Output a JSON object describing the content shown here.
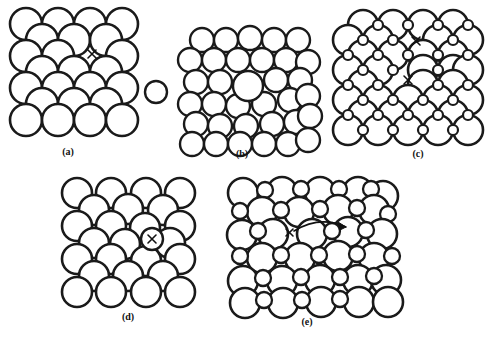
{
  "figure": {
    "background_color": "#ffffff",
    "line_color": "#1a1a1a",
    "atom_fill_color": "#ffffff",
    "panels": [
      {
        "id": "a",
        "label": "(a)",
        "label_x": 68,
        "label_y": 155,
        "description": "square lattice with vacancy and removed atom shown at right",
        "origin_x": 10,
        "origin_y": 8,
        "lattice": {
          "type": "square-offset",
          "cols": 4,
          "rows": 4,
          "spacing": 32,
          "radius_large": 16,
          "offset_x": 16,
          "offset_y": 16,
          "radius_small": 0
        },
        "defect_marks": [
          {
            "kind": "x",
            "x": 92,
            "y": 54,
            "size": 5
          }
        ],
        "extra_atoms": [
          {
            "x": 156,
            "y": 92,
            "r": 11,
            "kind": "removed-atom"
          }
        ]
      },
      {
        "id": "b",
        "label": "(b)",
        "label_x": 242,
        "label_y": 155,
        "description": "close-packed hexagonal arrangement containing one substitutional atom",
        "origin_x": 190,
        "origin_y": 30,
        "lattice": {
          "type": "close-packed",
          "cols": 5,
          "rows": 6,
          "spacing": 24,
          "radius_large": 12,
          "offset_x": 12,
          "offset_y": 21,
          "radius_small": 0
        },
        "defect_marks": [],
        "extra_atoms": [
          {
            "x": 242,
            "y": 85,
            "r": 15,
            "kind": "substitutional-atom"
          }
        ]
      },
      {
        "id": "c",
        "label": "(c)",
        "label_x": 418,
        "label_y": 155,
        "description": "ionic lattice of large anions and small cations with two Schottky vacancies",
        "origin_x": 348,
        "origin_y": 10,
        "lattice": {
          "type": "ionic-square",
          "cols": 4,
          "rows": 4,
          "spacing": 30,
          "radius_large": 15,
          "offset_x": 15,
          "offset_y": 15,
          "radius_small": 5
        },
        "defect_marks": [
          {
            "kind": "x",
            "x": 416,
            "y": 41,
            "size": 5
          },
          {
            "kind": "x",
            "x": 401,
            "y": 79,
            "size": 5
          }
        ],
        "extra_atoms": []
      },
      {
        "id": "d",
        "label": "(d)",
        "label_x": 128,
        "label_y": 318,
        "description": "square lattice with an interstitial atom squeezed between lattice sites",
        "origin_x": 62,
        "origin_y": 178,
        "lattice": {
          "type": "square-offset",
          "cols": 4,
          "rows": 4,
          "spacing": 30,
          "radius_large": 15,
          "offset_x": 15,
          "offset_y": 15,
          "radius_small": 0
        },
        "defect_marks": [
          {
            "kind": "x",
            "x": 152,
            "y": 238,
            "size": 5
          }
        ],
        "extra_atoms": []
      },
      {
        "id": "e",
        "label": "(e)",
        "label_x": 307,
        "label_y": 323,
        "description": "ionic lattice showing a Frenkel defect with curved arrow indicating ion migration",
        "origin_x": 228,
        "origin_y": 178,
        "lattice": {
          "type": "ionic-mixed",
          "cols": 5,
          "rows": 5,
          "spacing": 30,
          "radius_large": 15,
          "offset_x": 15,
          "offset_y": 15,
          "radius_small": 8
        },
        "defect_marks": [
          {
            "kind": "x",
            "x": 289,
            "y": 232,
            "size": 5
          }
        ],
        "extra_atoms": [],
        "arrow": {
          "kind": "migration-arrow",
          "start_x": 294,
          "start_y": 230,
          "ctrl_x": 320,
          "ctrl_y": 216,
          "end_x": 345,
          "end_y": 228
        }
      }
    ]
  }
}
